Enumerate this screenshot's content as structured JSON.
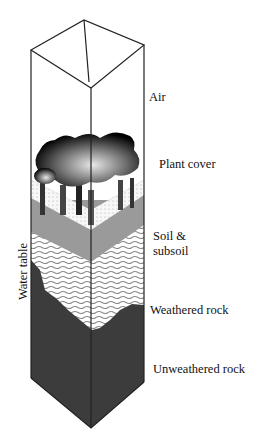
{
  "diagram": {
    "type": "soil-profile column",
    "labels": {
      "air": "Air",
      "plant_cover": "Plant cover",
      "soil_line1": "Soil &",
      "soil_line2": "subsoil",
      "weathered_rock": "Weathered rock",
      "unweathered_rock": "Unweathered rock",
      "water_table": "Water table"
    },
    "layers": [
      {
        "name": "Air",
        "fill": "#ffffff"
      },
      {
        "name": "Plant cover",
        "fill": "#1a1a1a"
      },
      {
        "name": "Soil & subsoil",
        "fill": "#f2f2f2"
      },
      {
        "name": "Saturated zone",
        "fill": "#9a9a9a"
      },
      {
        "name": "Weathered rock",
        "fill": "#e6e6e6"
      },
      {
        "name": "Unweathered rock",
        "fill": "#555555"
      }
    ]
  }
}
